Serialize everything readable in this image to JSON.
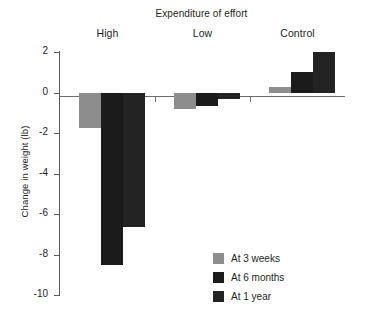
{
  "chart_data": {
    "type": "bar",
    "title": "Expenditure of effort",
    "xlabel": "",
    "ylabel": "Change in weight (lb)",
    "categories": [
      "High",
      "Low",
      "Control"
    ],
    "series": [
      {
        "name": "At 3 weeks",
        "color": "#8d8d8d",
        "values": [
          -1.75,
          -0.8,
          0.25
        ]
      },
      {
        "name": "At 6 months",
        "color": "#1b1b1b",
        "values": [
          -8.5,
          -0.65,
          1.0
        ]
      },
      {
        "name": "At 1 year",
        "color": "#232323",
        "values": [
          -6.65,
          -0.3,
          2.0
        ]
      }
    ],
    "ylim": [
      -10,
      2
    ],
    "yticks": [
      2,
      0,
      -2,
      -4,
      -6,
      -8,
      -10
    ],
    "ytick_labels": [
      "2",
      "0",
      "-2",
      "-4",
      "-6",
      "-8",
      "-10"
    ],
    "grid": false,
    "legend_position": "bottom-right",
    "zero_line": true
  },
  "legend": {
    "items": [
      {
        "label": "At 3 weeks",
        "color": "#8d8d8d"
      },
      {
        "label": "At 6 months",
        "color": "#1b1b1b"
      },
      {
        "label": "At 1 year",
        "color": "#232323"
      }
    ]
  }
}
